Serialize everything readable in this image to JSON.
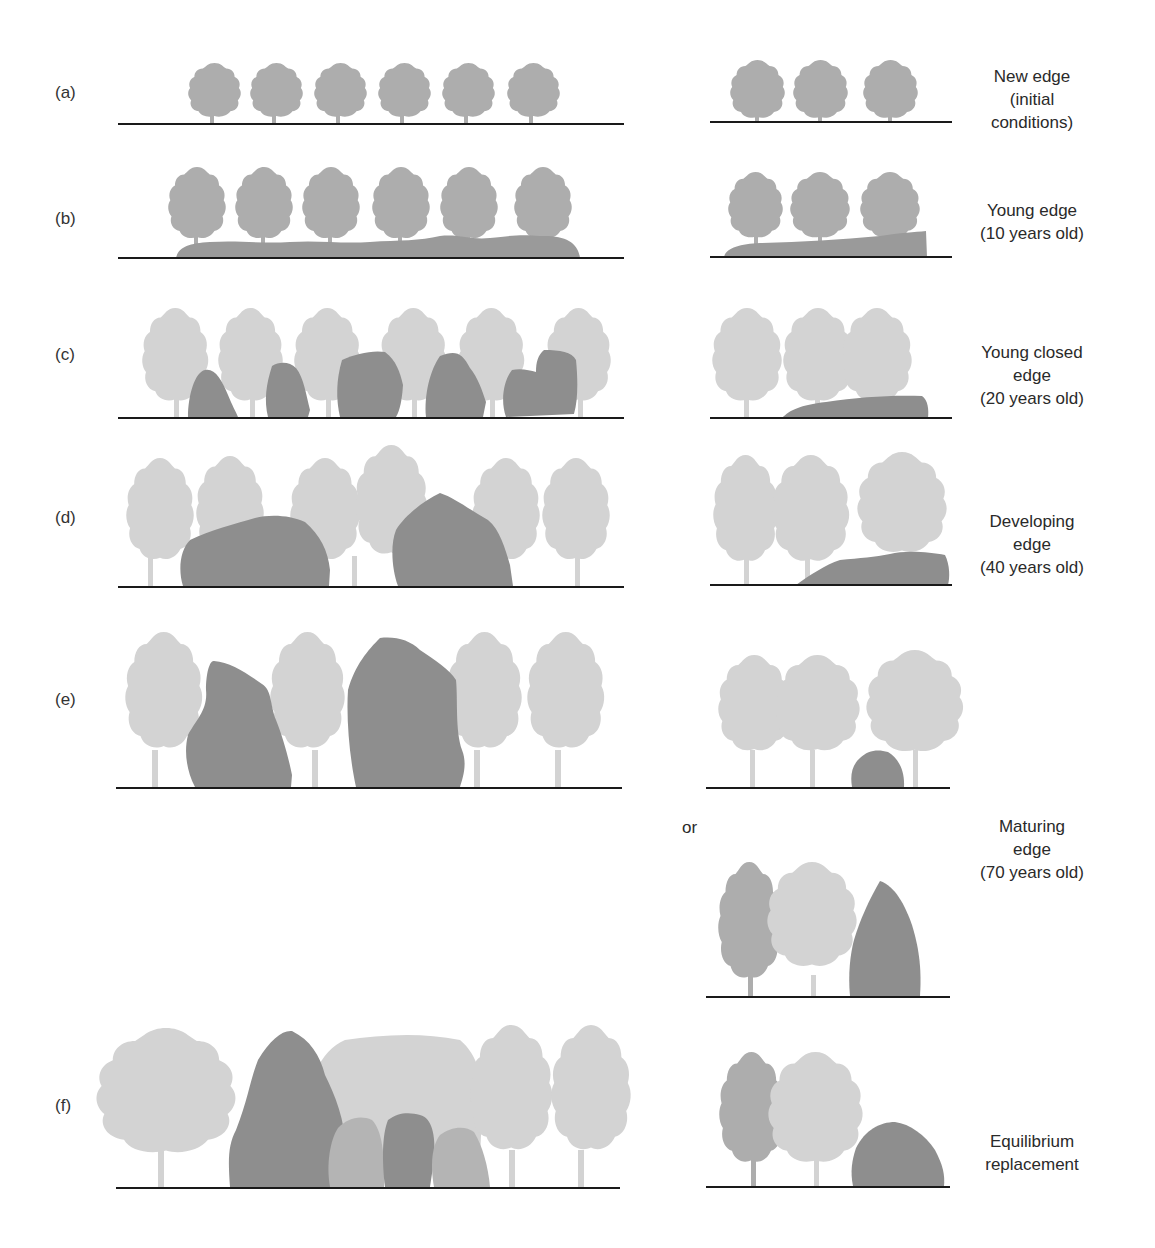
{
  "figure": {
    "colors": {
      "young_tree": "#adadad",
      "mature_tree": "#d3d3d3",
      "mid_tree": "#b4b4b4",
      "shrub": "#8e8e8e",
      "ground": "#1a1a1a"
    },
    "rows": [
      {
        "label": "(a)",
        "stage": [
          "New edge",
          "(initial",
          "conditions)"
        ]
      },
      {
        "label": "(b)",
        "stage": [
          "Young edge",
          "(10 years old)"
        ]
      },
      {
        "label": "(c)",
        "stage": [
          "Young closed",
          "edge",
          "(20 years old)"
        ]
      },
      {
        "label": "(d)",
        "stage": [
          "Developing",
          "edge",
          "(40 years old)"
        ]
      },
      {
        "label": "(e)",
        "stage": []
      },
      {
        "label": "",
        "stage": [
          "Maturing",
          "edge",
          "(70 years old)"
        ]
      },
      {
        "label": "(f)",
        "stage": [
          "Equilibrium",
          "replacement"
        ]
      }
    ],
    "or_label": "or"
  }
}
